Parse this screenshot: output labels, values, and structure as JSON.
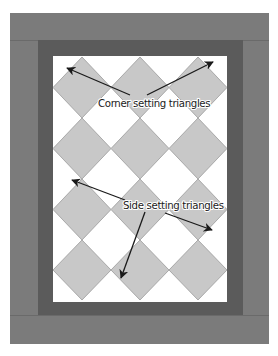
{
  "diagram": {
    "type": "quilt-layout",
    "colors": {
      "outer_border": "#7b7b7b",
      "inner_border": "#5b5b5b",
      "seam": "#6a6a6a",
      "background": "#ffffff",
      "block_fill": "#c8c8c8",
      "block_stroke": "#9a9a9a",
      "arrow": "#1a1a1a"
    },
    "grid": {
      "columns": 3,
      "rows": 4,
      "arrangement": "on-point diamonds"
    },
    "labels": {
      "corner": "Corner setting triangles",
      "side": "Side setting triangles"
    },
    "arrows": [
      {
        "group": "corner",
        "from": [
          130,
          95
        ],
        "to": [
          67,
          68
        ]
      },
      {
        "group": "corner",
        "from": [
          147,
          95
        ],
        "to": [
          213,
          62
        ]
      },
      {
        "group": "side",
        "from": [
          125,
          200
        ],
        "to": [
          72,
          180
        ]
      },
      {
        "group": "side",
        "from": [
          145,
          212
        ],
        "to": [
          121,
          278
        ]
      },
      {
        "group": "side",
        "from": [
          165,
          213
        ],
        "to": [
          212,
          230
        ]
      }
    ]
  }
}
